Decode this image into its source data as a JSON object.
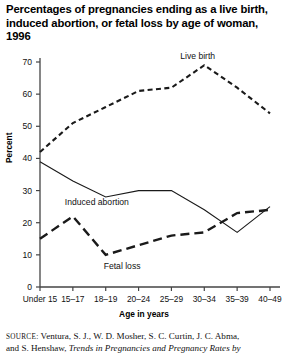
{
  "title": "Percentages of pregnancies ending as a live birth, induced abortion, or fetal loss by age of woman, 1996",
  "axis": {
    "ylabel": "Percent",
    "xlabel": "Age in years"
  },
  "labels": {
    "live_birth": "Live birth",
    "induced_abortion": "Induced abortion",
    "fetal_loss": "Fetal loss"
  },
  "source": {
    "prefix": "SOURCE:",
    "line1": " Ventura, S. J., W. D. Mosher, S. C. Curtin, J. C. Abma,",
    "line2_plain": "and S. Henshaw, ",
    "line2_italic": "Trends in Pregnancies and Pregnancy Rates by"
  },
  "chart_data": {
    "type": "line",
    "title": "Percentages of pregnancies ending as a live birth, induced abortion, or fetal loss by age of woman, 1996",
    "xlabel": "Age in years",
    "ylabel": "Percent",
    "ylim": [
      0,
      70
    ],
    "yticks": [
      0,
      10,
      20,
      30,
      40,
      50,
      60,
      70
    ],
    "grid": false,
    "legend": "inline-annotations",
    "categories": [
      "Under 15",
      "15–17",
      "18–19",
      "20–24",
      "25–29",
      "30–34",
      "35–39",
      "40–49"
    ],
    "series": [
      {
        "name": "Live birth",
        "style": "dashed",
        "values": [
          42,
          51,
          56,
          61,
          62,
          69,
          62,
          54
        ]
      },
      {
        "name": "Induced abortion",
        "style": "solid",
        "values": [
          39,
          33,
          28,
          30,
          30,
          24,
          17,
          25
        ]
      },
      {
        "name": "Fetal loss",
        "style": "long-dashed",
        "values": [
          15,
          22,
          10,
          13,
          16,
          17,
          23,
          24
        ]
      }
    ]
  }
}
